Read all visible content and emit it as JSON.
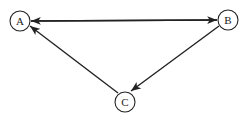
{
  "diagram": {
    "type": "directed-graph",
    "nodes": [
      {
        "id": "A",
        "label": "A",
        "x": 20,
        "y": 21
      },
      {
        "id": "B",
        "label": "B",
        "x": 228,
        "y": 20
      },
      {
        "id": "C",
        "label": "C",
        "x": 125,
        "y": 102
      }
    ],
    "edges": [
      {
        "from": "A",
        "to": "B"
      },
      {
        "from": "B",
        "to": "A"
      },
      {
        "from": "B",
        "to": "C"
      },
      {
        "from": "C",
        "to": "A"
      }
    ]
  }
}
